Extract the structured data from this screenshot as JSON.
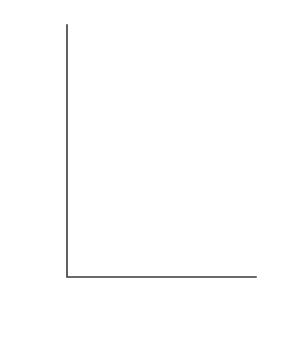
{
  "chart_data": {
    "type": "line",
    "title": "",
    "xlabel": "TIME (yr AD)",
    "ylabel": "RELATIVE LENGTH (m)",
    "xlim": [
      1500,
      2000
    ],
    "ylim": [
      -2000,
      1000
    ],
    "xticks": [
      1500,
      1600,
      1700,
      1800,
      1900,
      2000
    ],
    "xtick_labels": [
      "1500",
      "1600",
      "1700",
      "1800",
      "1900",
      "2000"
    ],
    "xminor_ticks": [
      1550,
      1650,
      1750,
      1850,
      1950
    ],
    "yticks": [
      1000,
      0,
      -1000,
      -2000
    ],
    "ytick_labels": [
      "1000",
      "0",
      "-1000",
      "-2000"
    ],
    "grid": false,
    "legend": false,
    "line_color": "#1a1a1a",
    "axis_color": "#3a3a3a",
    "text_color": "#4a4a4a",
    "series": [
      {
        "name": "relative length",
        "x": [
          1588,
          1602,
          1625,
          1660,
          1700,
          1715,
          1750,
          1782,
          1800,
          1818,
          1832,
          1845,
          1862,
          1870,
          1875,
          1900,
          1920,
          1925,
          1945,
          1960,
          1972,
          1980
        ],
        "y": [
          755,
          800,
          760,
          730,
          690,
          670,
          560,
          455,
          610,
          790,
          650,
          680,
          665,
          660,
          90,
          -530,
          -690,
          -740,
          -880,
          -1200,
          -1460,
          -1470
        ]
      }
    ],
    "annotations": [
      {
        "label": "1602",
        "x": 1602,
        "y": 960
      },
      {
        "label": "1818",
        "x": 1820,
        "y": 950
      },
      {
        "label": "1922",
        "x": 1932,
        "y": -540
      }
    ]
  }
}
